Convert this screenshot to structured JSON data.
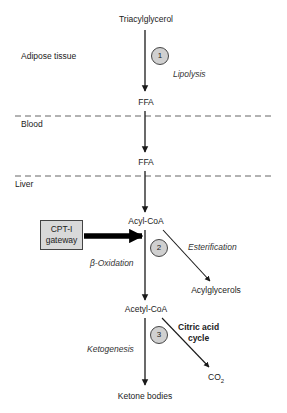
{
  "diagram": {
    "type": "metabolic-pathway",
    "compartments": [
      {
        "label": "Adipose tissue"
      },
      {
        "label": "Blood"
      },
      {
        "label": "Liver"
      }
    ],
    "nodes": {
      "triacylglycerol": "Triacylglycerol",
      "ffa_adipose": "FFA",
      "ffa_liver": "FFA",
      "acyl_coa": "Acyl-CoA",
      "acylglycerols": "Acylglycerols",
      "acetyl_coa": "Acetyl-CoA",
      "ketone_bodies": "Ketone bodies",
      "co2_main": "CO",
      "co2_sub": "2"
    },
    "steps": [
      {
        "number": "1",
        "label": "Lipolysis"
      },
      {
        "number": "2",
        "label": "Esterification"
      },
      {
        "number": "3",
        "label": "Ketogenesis"
      }
    ],
    "beta_oxidation": "β-Oxidation",
    "citric_acid_cycle": {
      "line1": "Citric acid",
      "line2": "cycle"
    },
    "gateway": {
      "line1": "CPT-I",
      "line2": "gateway"
    },
    "colors": {
      "line": "#1a1a1a",
      "circle_fill": "#d0d0d0",
      "box_fill": "#d9d9d9",
      "dashed": "#555555"
    }
  }
}
